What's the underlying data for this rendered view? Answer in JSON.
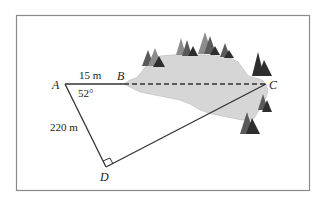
{
  "diagram": {
    "type": "geometry-surveying",
    "points": {
      "A": {
        "label": "A"
      },
      "B": {
        "label": "B"
      },
      "C": {
        "label": "C"
      },
      "D": {
        "label": "D"
      }
    },
    "measurements": {
      "AB": "15 m",
      "AD": "220 m",
      "angle_A": "52°"
    },
    "right_angle_at": "D",
    "dashed_segment": "BC",
    "colors": {
      "frame": "#8a8a8a",
      "lines": "#333333",
      "lake": "#d6d6d6",
      "tree_dark": "#2e2e2e",
      "tree_mid": "#5a5a5a",
      "tree_light": "#8c8c8c"
    }
  }
}
